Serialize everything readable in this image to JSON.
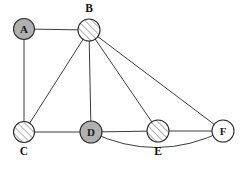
{
  "diagram": {
    "canvas": {
      "width": 243,
      "height": 180,
      "background": "#ffffff"
    },
    "style": {
      "edge_color": "#3d3d3d",
      "node_stroke": "#2b2b2b",
      "fill_solid_gray": "#b0b0b0",
      "fill_white": "#ffffff",
      "hatch_color": "#6e6e6e",
      "label_color": "#141414"
    },
    "nodes": [
      {
        "id": "A",
        "label": "A",
        "cx": 24,
        "cy": 29,
        "r": 10.5,
        "fill_style": "solid-gray",
        "label_position": "inside",
        "outer_label_x": 24,
        "outer_label_y": 29
      },
      {
        "id": "B",
        "label": "B",
        "cx": 89,
        "cy": 30,
        "r": 11,
        "fill_style": "hatched",
        "label_position": "outside-top",
        "outer_label_x": 89,
        "outer_label_y": 8
      },
      {
        "id": "C",
        "label": "C",
        "cx": 24,
        "cy": 132,
        "r": 10.5,
        "fill_style": "hatched",
        "label_position": "outside-bottom",
        "outer_label_x": 24,
        "outer_label_y": 151
      },
      {
        "id": "D",
        "label": "D",
        "cx": 91,
        "cy": 132,
        "r": 11,
        "fill_style": "solid-gray",
        "label_position": "inside",
        "outer_label_x": 91,
        "outer_label_y": 132
      },
      {
        "id": "E",
        "label": "E",
        "cx": 158,
        "cy": 131,
        "r": 11,
        "fill_style": "hatched",
        "label_position": "outside-bottom",
        "outer_label_x": 158,
        "outer_label_y": 151
      },
      {
        "id": "F",
        "label": "F",
        "cx": 223,
        "cy": 131,
        "r": 11,
        "fill_style": "white",
        "label_position": "inside",
        "outer_label_x": 223,
        "outer_label_y": 131
      }
    ],
    "edges": [
      {
        "id": "A-B",
        "from": "A",
        "to": "B",
        "shape": "straight"
      },
      {
        "id": "A-C",
        "from": "A",
        "to": "C",
        "shape": "straight"
      },
      {
        "id": "B-C",
        "from": "B",
        "to": "C",
        "shape": "straight"
      },
      {
        "id": "B-D",
        "from": "B",
        "to": "D",
        "shape": "straight"
      },
      {
        "id": "B-E",
        "from": "B",
        "to": "E",
        "shape": "straight"
      },
      {
        "id": "B-F",
        "from": "B",
        "to": "F",
        "shape": "straight"
      },
      {
        "id": "C-D",
        "from": "C",
        "to": "D",
        "shape": "straight"
      },
      {
        "id": "D-E",
        "from": "D",
        "to": "E",
        "shape": "straight"
      },
      {
        "id": "E-F",
        "from": "E",
        "to": "F",
        "shape": "straight"
      },
      {
        "id": "D-F",
        "from": "D",
        "to": "F",
        "shape": "curved",
        "curve_sag": 32
      }
    ]
  }
}
